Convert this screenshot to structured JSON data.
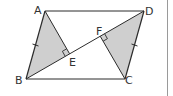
{
  "figure": {
    "type": "parallelogram-with-perpendiculars",
    "labels": {
      "A": "A",
      "B": "B",
      "C": "C",
      "D": "D",
      "E": "E",
      "F": "F"
    },
    "points": {
      "A": [
        45,
        11
      ],
      "B": [
        26,
        79
      ],
      "C": [
        125,
        79
      ],
      "D": [
        144,
        11
      ],
      "E": [
        69.6,
        53.8
      ],
      "F": [
        100.2,
        36.2
      ]
    },
    "shaded_triangles": [
      "ABE",
      "CDF"
    ],
    "right_angles": [
      "AEB",
      "CFD"
    ],
    "equal_ticks": [
      "AB",
      "CD"
    ],
    "colors": {
      "stroke": "#2b2b2b",
      "fill": "#cfcfcf",
      "border": "#9a9a9a"
    }
  }
}
